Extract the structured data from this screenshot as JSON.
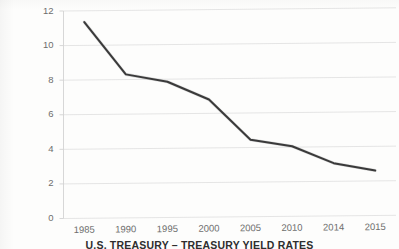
{
  "chart_data": {
    "type": "line",
    "title": "U.S. TREASURY – TREASURY YIELD RATES",
    "xlabel": "",
    "ylabel": "",
    "categories": [
      "1985",
      "1990",
      "1995",
      "2000",
      "2005",
      "2010",
      "2014",
      "2015"
    ],
    "values": [
      11.35,
      8.3,
      7.85,
      6.8,
      4.45,
      4.05,
      3.05,
      2.6
    ],
    "series": [
      {
        "name": "Treasury Yield Rate",
        "values": [
          11.35,
          8.3,
          7.85,
          6.8,
          4.45,
          4.05,
          3.05,
          2.6
        ]
      }
    ],
    "ylim": [
      0,
      12
    ],
    "yticks": [
      0,
      2,
      4,
      6,
      8,
      10,
      12
    ],
    "ytick_labels": [
      "0",
      "2",
      "4",
      "6",
      "8",
      "10",
      "12"
    ],
    "xtick_labels": [
      "1985",
      "1990",
      "1995",
      "2000",
      "2005",
      "2010",
      "2014",
      "2015"
    ],
    "grid": true,
    "grid_axis": "y",
    "legend": false,
    "legend_position": "none",
    "line_color": "#3a3a3a",
    "grid_color": "#e2e2e2",
    "axis_color": "#d2d2d2",
    "tick_label_color": "#6d6d6d",
    "title_color": "#2e2e2e",
    "background_color": "#fdfdfc",
    "markers": false
  },
  "axes": {
    "y_axis_name": "value-axis",
    "x_axis_name": "category-axis"
  }
}
